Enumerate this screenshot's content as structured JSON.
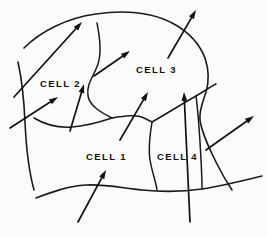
{
  "figure": {
    "background_color": "#fbfbfa",
    "ink_color": "#111111",
    "labels": [
      {
        "id": "cell-2",
        "text": "CELL 2",
        "x": 40,
        "y": 79
      },
      {
        "id": "cell-3",
        "text": "CELL 3",
        "x": 136,
        "y": 65
      },
      {
        "id": "cell-1",
        "text": "CELL 1",
        "x": 86,
        "y": 152
      },
      {
        "id": "cell-4",
        "text": "CELL 4",
        "x": 157,
        "y": 152
      }
    ],
    "outer_boundary": {
      "name": "grain-outer-boundary",
      "path": "M 18 62 C 26 48 44 36 62 28 C 84 18 112 11 140 12 C 166 13 186 24 199 40 C 210 53 214 68 212 82 C 210 96 203 108 203 120 C 203 133 208 146 212 158 C 216 170 219 180 221 188 C 206 193 186 196 166 195 C 146 194 126 190 108 189 C 90 188 74 191 62 196 C 50 201 42 205 36 206 C 32 196 29 182 27 166 C 25 148 24 128 23 108 C 22 88 20 74 18 62"
    },
    "boundary_segments": [
      {
        "name": "top-arc",
        "path": "M 24 48 C 40 32 66 18 96 14 C 124 10 152 12 174 24 C 190 33 200 45 205 58"
      },
      {
        "name": "right-upper",
        "path": "M 205 58 C 209 70 209 82 206 92 C 203 102 199 110 200 120"
      },
      {
        "name": "right-lower",
        "path": "M 200 120 C 202 134 210 150 217 164 C 223 176 228 184 232 190"
      },
      {
        "name": "bottom-wave",
        "path": "M 36 198 C 52 192 68 186 86 185 C 104 184 122 188 142 190 C 162 192 182 192 202 189 C 222 186 242 181 262 176"
      },
      {
        "name": "left-edge",
        "path": "M 18 62 C 22 80 24 100 25 122 C 26 144 28 168 34 190"
      }
    ],
    "internal_dividers": [
      {
        "name": "divider-cell2-cell3",
        "path": "M 97 23 C 100 38 102 52 98 64 C 94 76 86 84 88 96 C 90 106 100 112 112 118"
      },
      {
        "name": "divider-cell2-cell1",
        "path": "M 112 118 C 100 122 86 126 72 127 C 58 128 44 124 34 118"
      },
      {
        "name": "divider-cell1-cell3",
        "path": "M 112 118 C 124 116 136 114 144 118 C 150 121 152 122 152 122"
      },
      {
        "name": "divider-cell3-cell4",
        "path": "M 152 122 C 166 114 182 104 196 96 C 206 90 212 86 216 84"
      },
      {
        "name": "divider-cell1-cell4",
        "path": "M 152 122 C 150 134 148 148 150 160 C 152 172 156 182 157 190"
      },
      {
        "name": "divider-cell4-right",
        "path": "M 196 96 C 198 110 199 126 200 142 C 201 158 202 174 202 189"
      }
    ],
    "arrows": [
      {
        "name": "arrow-upper-left-long",
        "x1": 14,
        "y1": 97,
        "x2": 82,
        "y2": 22
      },
      {
        "name": "arrow-cell2-left",
        "x1": 10,
        "y1": 128,
        "x2": 58,
        "y2": 97
      },
      {
        "name": "arrow-cell2-lower",
        "x1": 70,
        "y1": 131,
        "x2": 84,
        "y2": 84
      },
      {
        "name": "arrow-cell2-cell3",
        "x1": 94,
        "y1": 76,
        "x2": 130,
        "y2": 51
      },
      {
        "name": "arrow-cell3-top",
        "x1": 168,
        "y1": 58,
        "x2": 196,
        "y2": 10
      },
      {
        "name": "arrow-cell3-lower",
        "x1": 120,
        "y1": 140,
        "x2": 148,
        "y2": 92
      },
      {
        "name": "arrow-cell4-vertical",
        "x1": 190,
        "y1": 222,
        "x2": 184,
        "y2": 92
      },
      {
        "name": "arrow-right-side",
        "x1": 206,
        "y1": 150,
        "x2": 254,
        "y2": 116
      },
      {
        "name": "arrow-cell1-bottom",
        "x1": 78,
        "y1": 222,
        "x2": 106,
        "y2": 170
      }
    ]
  }
}
